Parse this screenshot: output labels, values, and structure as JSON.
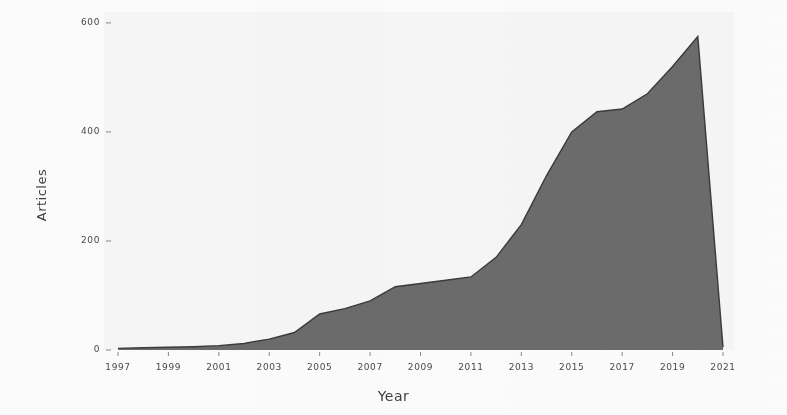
{
  "chart_data": {
    "type": "area",
    "title": "",
    "subtitle": "",
    "xlabel": "Year",
    "ylabel": "Articles",
    "xlim": [
      1997,
      2021
    ],
    "ylim": [
      0,
      620
    ],
    "grid": false,
    "legend": null,
    "legend_position": "none",
    "series_color": "#6e6e6e",
    "line_color": "#3a3a3a",
    "x_tick_labels": [
      "1997",
      "1999",
      "2001",
      "2003",
      "2005",
      "2007",
      "2009",
      "2011",
      "2013",
      "2015",
      "2017",
      "2019",
      "2021"
    ],
    "x_ticks": [
      1997,
      1999,
      2001,
      2003,
      2005,
      2007,
      2009,
      2011,
      2013,
      2015,
      2017,
      2019,
      2021
    ],
    "y_tick_labels": [
      "0",
      "200",
      "400",
      "600"
    ],
    "y_ticks": [
      0,
      200,
      400,
      600
    ],
    "x": [
      1997,
      1998,
      1999,
      2000,
      2001,
      2002,
      2003,
      2004,
      2005,
      2006,
      2007,
      2008,
      2009,
      2010,
      2011,
      2012,
      2013,
      2014,
      2015,
      2016,
      2017,
      2018,
      2019,
      2020,
      2021
    ],
    "values": [
      3,
      4,
      5,
      6,
      8,
      12,
      20,
      32,
      66,
      76,
      90,
      116,
      122,
      128,
      134,
      170,
      230,
      320,
      400,
      437,
      442,
      470,
      520,
      575,
      5
    ],
    "annotations": []
  },
  "axes": {
    "y_title": "Articles",
    "x_title": "Year"
  }
}
